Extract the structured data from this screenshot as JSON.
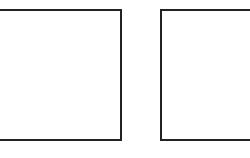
{
  "panels": [
    {
      "id": "left",
      "label": ""
    },
    {
      "id": "right",
      "label": ""
    }
  ],
  "colors": {
    "border": "#222222",
    "background": "#ffffff"
  }
}
